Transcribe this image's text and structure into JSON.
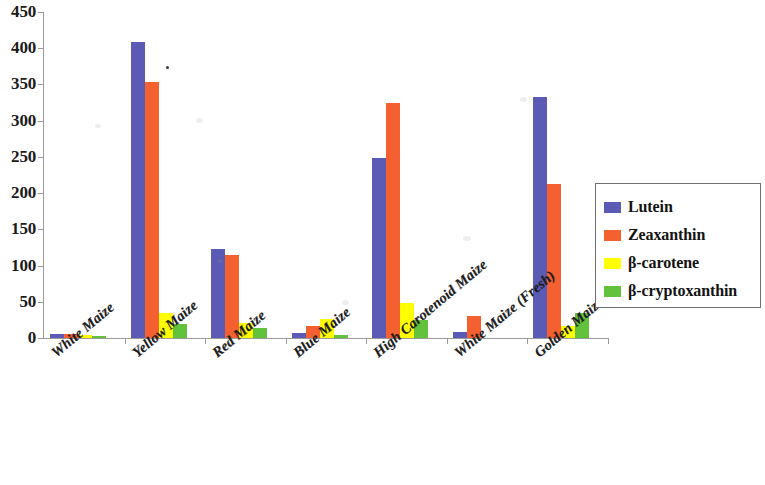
{
  "chart_data": {
    "type": "bar",
    "title": "",
    "xlabel": "",
    "ylabel": "",
    "ylim": [
      0,
      450
    ],
    "yticks": [
      0,
      50,
      100,
      150,
      200,
      250,
      300,
      350,
      400,
      450
    ],
    "grid": false,
    "legend_position": "right",
    "categories": [
      "White Maize",
      "Yellow Maize",
      "Red Maize",
      "Blue Maize",
      "High Carotenoid Maize",
      "White Maize (Fresh)",
      "Golden Maize (Fresh)"
    ],
    "series": [
      {
        "name": "Lutein",
        "color": "#5b5bb5",
        "values": [
          6,
          408,
          123,
          7,
          248,
          8,
          333
        ]
      },
      {
        "name": "Zeaxanthin",
        "color": "#f4602f",
        "values": [
          5,
          354,
          114,
          17,
          324,
          31,
          213
        ]
      },
      {
        "name": "β-carotene",
        "color": "#ffff00",
        "values": [
          4,
          34,
          21,
          26,
          48,
          0,
          16
        ]
      },
      {
        "name": "β-cryptoxanthin",
        "color": "#63c23c",
        "values": [
          3,
          19,
          14,
          4,
          25,
          0,
          35
        ]
      }
    ]
  },
  "legend": {
    "items": [
      {
        "label": "Lutein",
        "swatch": "lutein"
      },
      {
        "label": "Zeaxanthin",
        "swatch": "zeaxanthin"
      },
      {
        "label": "β-carotene",
        "swatch": "carotene"
      },
      {
        "label": "β-cryptoxanthin",
        "swatch": "cryptoxanthin"
      }
    ]
  }
}
